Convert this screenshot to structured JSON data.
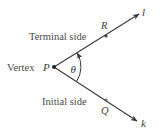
{
  "diagram": {
    "colors": {
      "ray": "#3a3a3a",
      "text": "#4a4a4a",
      "background": "#ffffff"
    },
    "vertex": {
      "label": "Vertex",
      "point_name": "P",
      "x": 54,
      "y": 67
    },
    "terminal_side": {
      "label": "Terminal side",
      "ray_name": "l",
      "point": {
        "name": "R",
        "x": 106,
        "y": 36
      },
      "end": {
        "x": 139,
        "y": 14
      }
    },
    "initial_side": {
      "label": "Initial side",
      "ray_name": "k",
      "point": {
        "name": "Q",
        "x": 106,
        "y": 100
      },
      "end": {
        "x": 137,
        "y": 121
      }
    },
    "angle": {
      "symbol": "θ",
      "direction": "counterclockwise"
    }
  }
}
